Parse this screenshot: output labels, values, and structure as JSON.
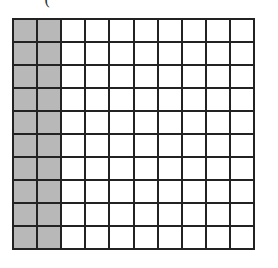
{
  "top_mark": "(",
  "grid": {
    "rows": 10,
    "cols": 10,
    "shaded_columns": 2,
    "shaded_cells": 20,
    "total_cells": 100,
    "shade_color": "#b8b8b8",
    "line_color": "#222222"
  }
}
